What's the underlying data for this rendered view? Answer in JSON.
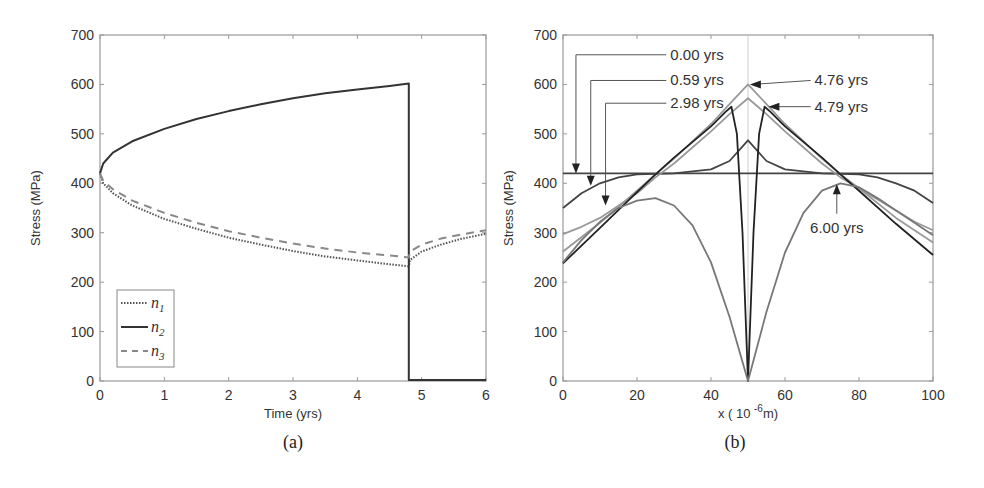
{
  "figure": {
    "caption_a": "(a)",
    "caption_b": "(b)"
  },
  "chart_data": [
    {
      "id": "a",
      "type": "line",
      "title": "",
      "xlabel": "Time (yrs)",
      "ylabel": "Stress (MPa)",
      "xlim": [
        0,
        6
      ],
      "ylim": [
        0,
        700
      ],
      "xticks": [
        0,
        1,
        2,
        3,
        4,
        5,
        6
      ],
      "yticks": [
        0,
        100,
        200,
        300,
        400,
        500,
        600,
        700
      ],
      "grid": false,
      "legend_position": "lower-left",
      "series": [
        {
          "name": "n1",
          "legend_label": "n",
          "legend_sub": "1",
          "style": "dotted",
          "color": "#555555",
          "x": [
            0,
            0.05,
            0.2,
            0.5,
            1,
            1.5,
            2,
            2.5,
            3,
            3.5,
            4,
            4.5,
            4.8,
            4.82,
            5,
            5.3,
            5.6,
            6
          ],
          "y": [
            420,
            400,
            380,
            355,
            328,
            308,
            290,
            276,
            263,
            252,
            244,
            236,
            232,
            245,
            262,
            276,
            287,
            298
          ]
        },
        {
          "name": "n2",
          "legend_label": "n",
          "legend_sub": "2",
          "style": "solid",
          "color": "#333333",
          "x": [
            0,
            0.05,
            0.2,
            0.5,
            1,
            1.5,
            2,
            2.5,
            3,
            3.5,
            4,
            4.5,
            4.8,
            4.8,
            6
          ],
          "y": [
            420,
            440,
            462,
            485,
            510,
            530,
            546,
            560,
            572,
            582,
            590,
            597,
            602,
            2,
            2
          ]
        },
        {
          "name": "n3",
          "legend_label": "n",
          "legend_sub": "3",
          "style": "dashed",
          "color": "#888888",
          "x": [
            0,
            0.05,
            0.2,
            0.5,
            1,
            1.5,
            2,
            2.5,
            3,
            3.5,
            4,
            4.5,
            4.8,
            4.82,
            5,
            5.3,
            5.6,
            6
          ],
          "y": [
            420,
            405,
            388,
            365,
            340,
            320,
            303,
            290,
            278,
            268,
            260,
            254,
            250,
            262,
            276,
            288,
            296,
            305
          ]
        }
      ]
    },
    {
      "id": "b",
      "type": "line",
      "title": "",
      "xlabel": "x ( 10 ",
      "xlabel_sup": "-6",
      "xlabel_end": "m)",
      "ylabel": "Stress (MPa)",
      "xlim": [
        0,
        100
      ],
      "ylim": [
        0,
        700
      ],
      "xticks": [
        0,
        20,
        40,
        60,
        80,
        100
      ],
      "yticks": [
        0,
        100,
        200,
        300,
        400,
        500,
        600,
        700
      ],
      "grid": false,
      "center_line_x": 50,
      "series": [
        {
          "name": "0.00 yrs",
          "color": "#444444",
          "x": [
            0,
            100
          ],
          "y": [
            420,
            420
          ]
        },
        {
          "name": "0.59 yrs",
          "color": "#444444",
          "x": [
            0,
            5,
            10,
            15,
            20,
            30,
            40,
            45,
            48,
            50,
            52,
            55,
            60,
            70,
            80,
            85,
            90,
            95,
            100
          ],
          "y": [
            350,
            380,
            400,
            412,
            418,
            420,
            428,
            445,
            470,
            487,
            470,
            445,
            428,
            420,
            418,
            412,
            400,
            385,
            360
          ]
        },
        {
          "name": "2.98 yrs",
          "color": "#999999",
          "x": [
            0,
            5,
            10,
            20,
            25,
            30,
            40,
            45,
            50,
            55,
            60,
            70,
            75,
            80,
            90,
            95,
            100
          ],
          "y": [
            297,
            312,
            330,
            380,
            412,
            440,
            505,
            540,
            572,
            540,
            505,
            440,
            412,
            390,
            345,
            322,
            305
          ]
        },
        {
          "name": "4.76 yrs",
          "color": "#999999",
          "x": [
            0,
            10,
            20,
            25,
            30,
            40,
            45,
            50,
            55,
            60,
            70,
            75,
            80,
            90,
            100
          ],
          "y": [
            262,
            320,
            385,
            418,
            450,
            520,
            560,
            600,
            560,
            520,
            450,
            418,
            390,
            330,
            280
          ]
        },
        {
          "name": "4.79 yrs",
          "color": "#222222",
          "x": [
            0,
            10,
            20,
            25,
            30,
            40,
            44,
            45.5,
            47,
            48.5,
            50,
            51.5,
            53,
            54.5,
            56,
            60,
            70,
            75,
            80,
            90,
            100
          ],
          "y": [
            238,
            310,
            382,
            418,
            452,
            515,
            545,
            555,
            500,
            300,
            0,
            300,
            500,
            555,
            545,
            515,
            452,
            418,
            385,
            318,
            255
          ]
        },
        {
          "name": "6.00 yrs",
          "color": "#777777",
          "x": [
            0,
            5,
            10,
            15,
            20,
            25,
            30,
            35,
            40,
            45,
            50,
            55,
            60,
            65,
            70,
            75,
            80,
            85,
            90,
            95,
            100
          ],
          "y": [
            240,
            285,
            322,
            350,
            365,
            370,
            355,
            315,
            240,
            130,
            0,
            140,
            260,
            340,
            385,
            400,
            392,
            370,
            345,
            320,
            295
          ]
        }
      ],
      "annotations": [
        {
          "text": "0.00 yrs",
          "side": "left",
          "label_x": 29,
          "label_y": 660,
          "target_x": 3.5,
          "target_y": 420
        },
        {
          "text": "0.59 yrs",
          "side": "left",
          "label_x": 29,
          "label_y": 608,
          "target_x": 7.5,
          "target_y": 395
        },
        {
          "text": "2.98 yrs",
          "side": "left",
          "label_x": 29,
          "label_y": 562,
          "target_x": 11.5,
          "target_y": 355
        },
        {
          "text": "4.76 yrs",
          "side": "right",
          "label_x": 68,
          "label_y": 608,
          "target_x": 50.5,
          "target_y": 600
        },
        {
          "text": "4.79 yrs",
          "side": "right",
          "label_x": 68,
          "label_y": 555,
          "target_x": 55.5,
          "target_y": 555
        },
        {
          "text": "6.00 yrs",
          "side": "below",
          "label_x": 74,
          "label_y": 310,
          "target_x": 74,
          "target_y": 398
        }
      ]
    }
  ]
}
